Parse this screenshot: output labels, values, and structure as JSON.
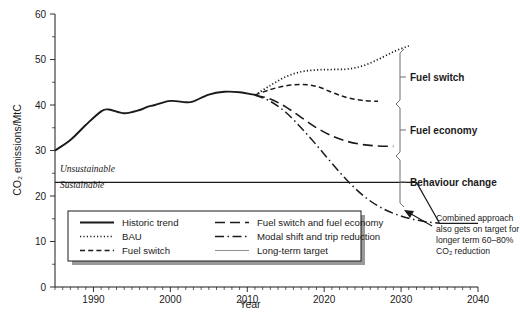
{
  "chart_data": {
    "type": "line",
    "title": "",
    "xlabel": "Year",
    "ylabel": "CO2 emissions/MtC",
    "ylabel_display": "CO₂ emissions/MtC",
    "xlim": [
      1985,
      2040
    ],
    "ylim": [
      0,
      60
    ],
    "grid": false,
    "legend_position": "inside-bottom-left",
    "xticks": [
      1990,
      2000,
      2010,
      2020,
      2030,
      2040
    ],
    "xtick_labels": [
      "1990",
      "2000",
      "2010",
      "2020",
      "2030",
      "2040"
    ],
    "xminor_step": 1,
    "yticks": [
      0,
      10,
      20,
      30,
      40,
      50,
      60
    ],
    "ytick_labels": [
      "0",
      "10",
      "20",
      "30",
      "40",
      "50",
      "60"
    ],
    "yminor_step": 5,
    "series": [
      {
        "name": "Historic trend",
        "style": "solid",
        "x": [
          1985,
          1987,
          1989,
          1991,
          1992,
          1994,
          1996,
          1997,
          1998,
          2000,
          2002,
          2003,
          2005,
          2007,
          2009,
          2011
        ],
        "values": [
          30.0,
          32.3,
          35.6,
          38.6,
          39.0,
          38.2,
          38.9,
          39.6,
          40.0,
          40.9,
          40.6,
          40.8,
          42.3,
          42.9,
          42.8,
          42.2
        ]
      },
      {
        "name": "BAU",
        "style": "dotted",
        "x": [
          2011,
          2013,
          2015,
          2017,
          2019,
          2021,
          2023,
          2025,
          2027,
          2029,
          2031
        ],
        "values": [
          42.2,
          44.3,
          46.2,
          47.3,
          47.7,
          47.8,
          47.9,
          48.6,
          50.0,
          51.7,
          53.0
        ]
      },
      {
        "name": "Fuel switch",
        "style": "dashed",
        "x": [
          2011,
          2013,
          2015,
          2017,
          2019,
          2021,
          2023,
          2025,
          2027
        ],
        "values": [
          42.2,
          43.4,
          44.2,
          44.5,
          44.1,
          42.8,
          41.6,
          41.0,
          40.8
        ]
      },
      {
        "name": "Fuel switch and fuel economy",
        "style": "long-dashed",
        "x": [
          2011,
          2013,
          2015,
          2017,
          2019,
          2021,
          2023,
          2025,
          2027,
          2029
        ],
        "values": [
          42.2,
          41.3,
          39.6,
          37.3,
          35.0,
          33.2,
          32.0,
          31.3,
          31.0,
          30.9
        ]
      },
      {
        "name": "Modal shift and trip reduction",
        "style": "dash-dot",
        "x": [
          2011,
          2013,
          2015,
          2017,
          2019,
          2021,
          2023,
          2025,
          2027,
          2029,
          2031,
          2033,
          2035
        ],
        "values": [
          42.2,
          40.8,
          38.4,
          35.0,
          31.2,
          27.2,
          23.4,
          20.2,
          17.8,
          16.2,
          15.1,
          14.4,
          14.0
        ]
      },
      {
        "name": "Long-term target",
        "style": "solid-grey",
        "x": [
          1985,
          2032,
          2035,
          2040
        ],
        "values": [
          23.0,
          23.0,
          14.0,
          14.0
        ]
      }
    ],
    "band_labels": [
      {
        "text": "Unsustainable",
        "x": 1986,
        "y": 24.4
      },
      {
        "text": "Sustainable",
        "x": 1986,
        "y": 21.0
      }
    ],
    "annotations": [
      {
        "text": "Fuel switch",
        "type": "bracket-label"
      },
      {
        "text": "Fuel economy",
        "type": "bracket-label"
      },
      {
        "text": "Behaviour change",
        "type": "bracket-label"
      },
      {
        "text": "Combined approach",
        "type": "callout-line"
      },
      {
        "text": "also gets on target for",
        "type": "callout-line"
      },
      {
        "text": "longer term 60–80%",
        "type": "callout-line"
      },
      {
        "text": "CO₂ reduction",
        "type": "callout-line"
      }
    ]
  },
  "axes": {
    "ylabel": "CO₂ emissions/MtC",
    "xlabel": "Year",
    "xtick_labels": [
      "1990",
      "2000",
      "2010",
      "2020",
      "2030",
      "2040"
    ],
    "ytick_labels": [
      "0",
      "10",
      "20",
      "30",
      "40",
      "50",
      "60"
    ]
  },
  "bands": {
    "unsustainable": "Unsustainable",
    "sustainable": "Sustainable"
  },
  "brackets": {
    "fuel_switch": "Fuel switch",
    "fuel_economy": "Fuel economy",
    "behaviour_change": "Behaviour change"
  },
  "callout": {
    "line1": "Combined approach",
    "line2": "also gets on target for",
    "line3": "longer term 60–80%",
    "line4": "CO₂ reduction"
  },
  "legend": {
    "items": [
      {
        "label": "Historic trend",
        "style": "solid"
      },
      {
        "label": "BAU",
        "style": "dotted"
      },
      {
        "label": "Fuel switch",
        "style": "dashed"
      },
      {
        "label": "Fuel switch and fuel economy",
        "style": "long-dashed"
      },
      {
        "label": "Modal shift and trip reduction",
        "style": "dash-dot"
      },
      {
        "label": "Long-term target",
        "style": "solid-grey"
      }
    ]
  },
  "colors": {
    "ink": "#1a1a1a",
    "grey": "#8f8f8f",
    "bracket": "#6f6f6f",
    "background": "#ffffff"
  }
}
